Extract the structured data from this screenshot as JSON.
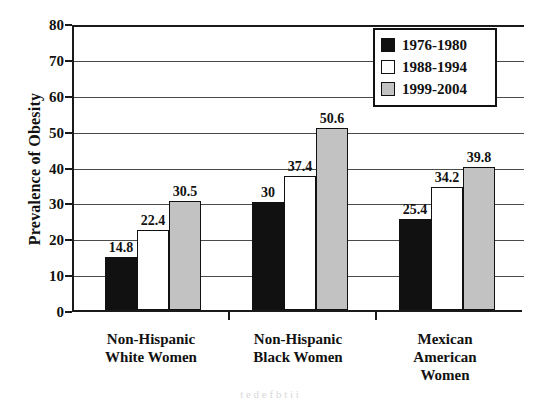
{
  "chart_data": {
    "type": "bar",
    "title": "",
    "xlabel": "",
    "ylabel": "Prevalence of Obesity",
    "ylim": [
      0,
      80
    ],
    "yticks": [
      0,
      10,
      20,
      30,
      40,
      50,
      60,
      70,
      80
    ],
    "grid": true,
    "legend_position": "top-right",
    "categories": [
      "Non-Hispanic\nWhite Women",
      "Non-Hispanic\nBlack Women",
      "Mexican\nAmerican\nWomen"
    ],
    "series": [
      {
        "name": "1976-1980",
        "color": "#111111",
        "values": [
          14.8,
          30,
          25.4
        ],
        "labels": [
          "14.8",
          "30",
          "25.4"
        ]
      },
      {
        "name": "1988-1994",
        "color": "#ffffff",
        "values": [
          22.4,
          37.4,
          34.2
        ],
        "labels": [
          "22.4",
          "37.4",
          "34.2"
        ]
      },
      {
        "name": "1999-2004",
        "color": "#c2c2c2",
        "values": [
          30.5,
          50.6,
          39.8
        ],
        "labels": [
          "30.5",
          "50.6",
          "39.8"
        ]
      }
    ]
  },
  "legend": {
    "items": [
      {
        "label": "1976-1980",
        "swatch": "s0"
      },
      {
        "label": "1988-1994",
        "swatch": "s1"
      },
      {
        "label": "1999-2004",
        "swatch": "s2"
      }
    ]
  },
  "bleed_text": "t   e  d  e       f  b  t   i      i"
}
